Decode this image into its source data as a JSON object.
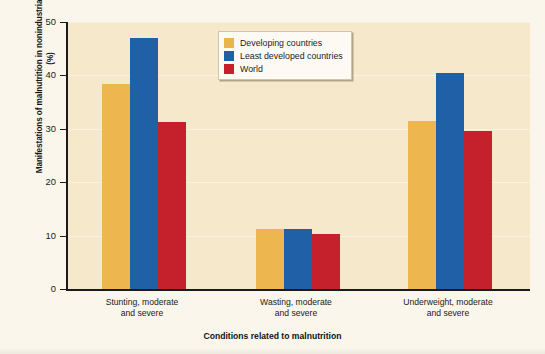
{
  "chart_data": {
    "type": "bar",
    "title": "",
    "xlabel": "Conditions related to malnutrition",
    "ylabel": "Manifestations of malnutrition in nonindustrialized countries (%)",
    "categories": [
      "Stunting, moderate and severe",
      "Wasting, moderate and severe",
      "Underweight, moderate and severe"
    ],
    "category_lines": [
      [
        "Stunting, moderate",
        "and severe"
      ],
      [
        "Wasting, moderate",
        "and severe"
      ],
      [
        "Underweight, moderate",
        "and severe"
      ]
    ],
    "series": [
      {
        "name": "Developing countries",
        "color": "#edb64e",
        "values": [
          38.3,
          11.2,
          31.4
        ]
      },
      {
        "name": "Least developed countries",
        "color": "#2060a6",
        "values": [
          47.0,
          11.2,
          40.5
        ]
      },
      {
        "name": "World",
        "color": "#c5212d",
        "values": [
          31.3,
          10.3,
          29.6
        ]
      }
    ],
    "ylim": [
      0,
      50
    ],
    "yticks": [
      0,
      10,
      20,
      30,
      40,
      50
    ],
    "ytick_labels": [
      "0",
      "10",
      "20",
      "30",
      "40",
      "50"
    ],
    "grid": false,
    "legend_position": "top-center",
    "plot_background": "#f6e9cb",
    "figure_background": "#faf6ec",
    "axis_color": "#1a1a1a"
  },
  "legend": {
    "entries": [
      {
        "label": "Developing countries"
      },
      {
        "label": "Least developed countries"
      },
      {
        "label": "World"
      }
    ]
  }
}
